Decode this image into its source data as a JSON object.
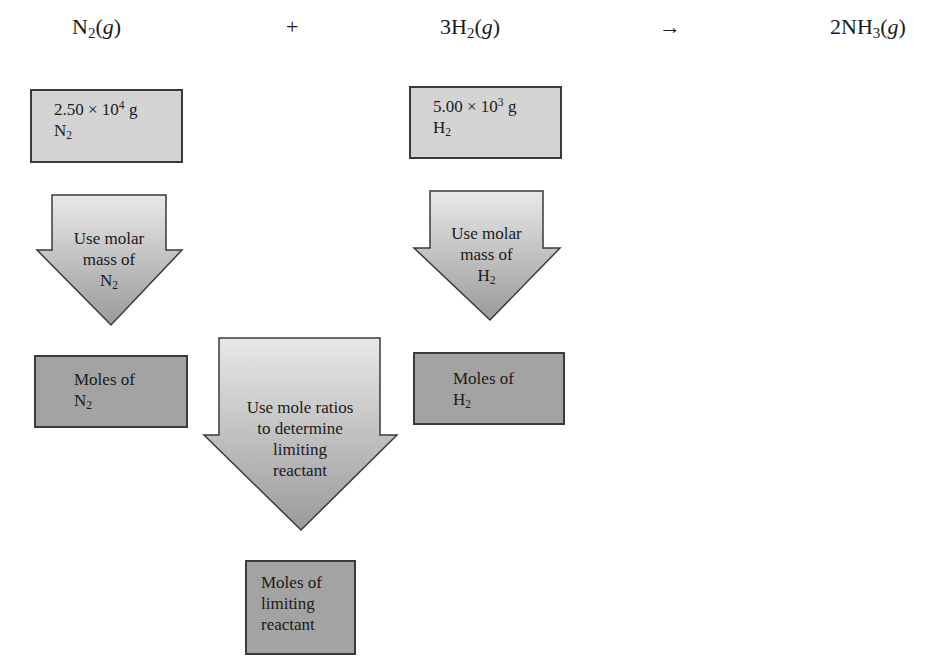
{
  "equation": {
    "reactant1": {
      "coef": "",
      "symbol": "N",
      "sub": "2",
      "state": "g"
    },
    "plus": "+",
    "reactant2": {
      "coef": "3",
      "symbol": "H",
      "sub": "2",
      "state": "g"
    },
    "yields": "→",
    "product": {
      "coef": "2",
      "symbol": "NH",
      "sub": "3",
      "state": "g"
    }
  },
  "nodes": {
    "n2_mass": {
      "mantissa": "2.50 × 10",
      "exp": "4",
      "unit": " g",
      "species": "N",
      "species_sub": "2"
    },
    "h2_mass": {
      "mantissa": "5.00 × 10",
      "exp": "3",
      "unit": " g",
      "species": "H",
      "species_sub": "2"
    },
    "n2_moles": {
      "line1": "Moles of",
      "species": "N",
      "species_sub": "2"
    },
    "h2_moles": {
      "line1": "Moles of",
      "species": "H",
      "species_sub": "2"
    },
    "limiting_moles": {
      "line1": "Moles of",
      "line2": "limiting",
      "line3": "reactant"
    }
  },
  "steps": {
    "n2_molar_mass": {
      "line1": "Use molar",
      "line2": "mass of",
      "species": "N",
      "species_sub": "2"
    },
    "h2_molar_mass": {
      "line1": "Use molar",
      "line2": "mass of",
      "species": "H",
      "species_sub": "2"
    },
    "mole_ratio": {
      "line1": "Use mole ratios",
      "line2": "to determine",
      "line3": "limiting",
      "line4": "reactant"
    }
  },
  "colors": {
    "mass_box": "#d4d4d4",
    "moles_box": "#a3a3a3",
    "arrow_top": "#e6e6e6",
    "arrow_bottom": "#9a9a9a",
    "border": "#3a3a3a"
  }
}
